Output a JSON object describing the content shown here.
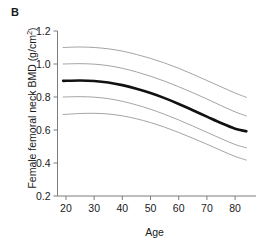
{
  "panel": {
    "label": "B"
  },
  "chart_data": {
    "type": "line",
    "title": "",
    "xlabel": "Age",
    "ylabel": "Female femoral neck BMD (g/cm²)",
    "ylabel_base": "Female femoral neck BMD (g/cm",
    "ylabel_sup": "2",
    "ylabel_tail": ")",
    "xlim": [
      17,
      86
    ],
    "ylim": [
      0.2,
      1.2
    ],
    "xticks": [
      20,
      30,
      40,
      50,
      60,
      70,
      80
    ],
    "xtick_labels": [
      "20",
      "30",
      "40",
      "50",
      "60",
      "70",
      "80"
    ],
    "yticks": [
      0.2,
      0.4,
      0.6,
      0.8,
      1.0,
      1.2
    ],
    "ytick_labels": [
      "0.2",
      "0.4",
      "0.6",
      "0.8",
      "1.0",
      "1.2"
    ],
    "grid": false,
    "legend": "none",
    "x": [
      19,
      25,
      30,
      35,
      40,
      45,
      50,
      55,
      60,
      65,
      70,
      75,
      80,
      84
    ],
    "series": [
      {
        "name": "95th percentile",
        "style": "thin",
        "color": "#9a9a9a",
        "width": 0.9,
        "values": [
          1.1,
          1.103,
          1.1,
          1.092,
          1.078,
          1.058,
          1.034,
          1.006,
          0.974,
          0.938,
          0.9,
          0.862,
          0.824,
          0.798
        ]
      },
      {
        "name": "75th percentile",
        "style": "thin",
        "color": "#9a9a9a",
        "width": 0.9,
        "values": [
          1.0,
          1.002,
          0.999,
          0.99,
          0.974,
          0.952,
          0.926,
          0.896,
          0.862,
          0.826,
          0.788,
          0.748,
          0.71,
          0.685
        ]
      },
      {
        "name": "Mean",
        "style": "thick",
        "color": "#111111",
        "width": 2.6,
        "values": [
          0.898,
          0.9,
          0.897,
          0.888,
          0.872,
          0.85,
          0.824,
          0.793,
          0.758,
          0.72,
          0.681,
          0.642,
          0.608,
          0.592
        ]
      },
      {
        "name": "25th percentile",
        "style": "thin",
        "color": "#9a9a9a",
        "width": 0.9,
        "values": [
          0.8,
          0.802,
          0.799,
          0.79,
          0.774,
          0.752,
          0.726,
          0.695,
          0.661,
          0.624,
          0.586,
          0.548,
          0.512,
          0.492
        ]
      },
      {
        "name": "5th percentile",
        "style": "thin",
        "color": "#9a9a9a",
        "width": 0.9,
        "values": [
          0.694,
          0.7,
          0.701,
          0.697,
          0.686,
          0.668,
          0.645,
          0.617,
          0.585,
          0.55,
          0.514,
          0.476,
          0.44,
          0.418
        ]
      }
    ]
  },
  "colors": {
    "axis": "#7d7d7d",
    "thin_line": "#9a9a9a",
    "thick_line": "#111111",
    "text": "#1a1a1a",
    "background": "#ffffff"
  }
}
